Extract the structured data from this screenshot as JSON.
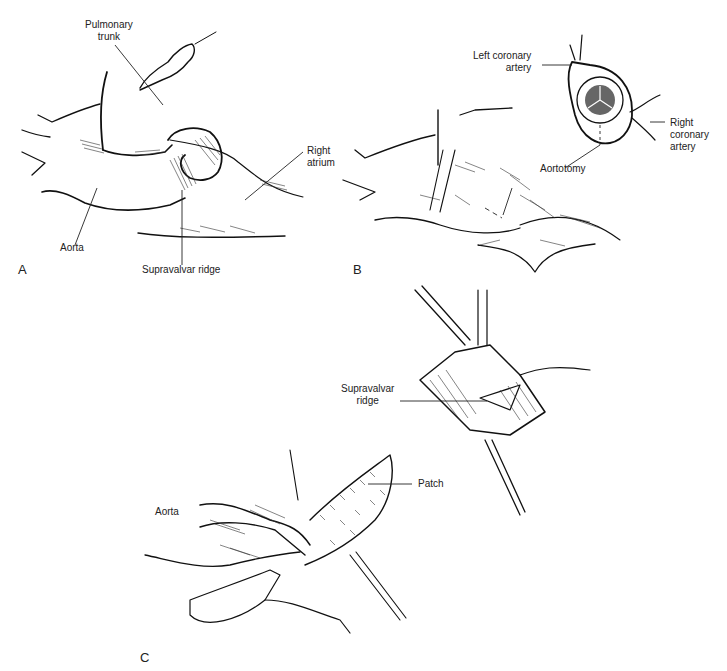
{
  "figure": {
    "panels": [
      {
        "id": "A",
        "letter": "A",
        "labels": {
          "pulmonary_trunk": "Pulmonary\ntrunk",
          "right_atrium": "Right\natrium",
          "aorta": "Aorta",
          "supravalvar_ridge": "Supravalvar ridge"
        }
      },
      {
        "id": "B",
        "letter": "B",
        "labels": {
          "left_coronary_artery": "Left coronary\nartery",
          "right_coronary_artery": "Right\ncoronary\nartery",
          "aortotomy": "Aortotomy"
        }
      },
      {
        "id": "C",
        "letter": "C",
        "labels": {
          "supravalvar_ridge": "Supravalvar\nridge",
          "patch": "Patch",
          "aorta": "Aorta"
        }
      }
    ]
  }
}
